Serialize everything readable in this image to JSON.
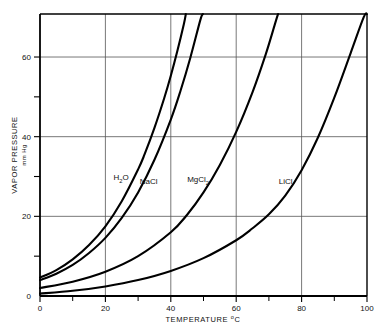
{
  "chart_data": {
    "type": "line",
    "title": "",
    "xlabel": "TEMPERATURE °C",
    "xlabel_main": "TEMPERATURE",
    "xlabel_unit_sup": "o",
    "xlabel_unit": "C",
    "ylabel": "VAPOR PRESSURE",
    "ylabel_sub": "mm Hg",
    "xlim": [
      0,
      100
    ],
    "ylim": [
      0,
      70.8
    ],
    "xticks": [
      0,
      20,
      40,
      60,
      80,
      100
    ],
    "xtick_labels": [
      "0",
      "20",
      "40",
      "60",
      "80",
      "100"
    ],
    "xminor": [
      10,
      30,
      50,
      70,
      90
    ],
    "yticks": [
      0,
      20,
      40,
      60
    ],
    "ytick_labels": [
      "0",
      "20",
      "40",
      "60"
    ],
    "yminor": [
      10,
      30,
      50
    ],
    "grid": "major-xy",
    "legend": "inline-annotations",
    "line_color": "#000000",
    "grid_color": "#555555",
    "frame_color": "#000000",
    "series": [
      {
        "name": "H2O",
        "label_main": "H",
        "label_sub": "2",
        "label_tail": "O",
        "label_x": 22.5,
        "label_y": 29.0,
        "points": [
          [
            0,
            4.6
          ],
          [
            5,
            6.5
          ],
          [
            10,
            9.2
          ],
          [
            15,
            12.8
          ],
          [
            20,
            17.5
          ],
          [
            25,
            23.8
          ],
          [
            30,
            31.8
          ],
          [
            32,
            35.6
          ],
          [
            35,
            42.2
          ],
          [
            38,
            49.7
          ],
          [
            40,
            55.3
          ],
          [
            42,
            61.5
          ],
          [
            44,
            68.3
          ],
          [
            44.6,
            70.8
          ]
        ]
      },
      {
        "name": "NaCl",
        "label_main": "NaCl",
        "label_sub": "",
        "label_tail": "",
        "label_x": 30.5,
        "label_y": 28.0,
        "points": [
          [
            0,
            4.0
          ],
          [
            5,
            5.6
          ],
          [
            10,
            7.8
          ],
          [
            15,
            10.8
          ],
          [
            20,
            14.6
          ],
          [
            25,
            19.6
          ],
          [
            30,
            26.0
          ],
          [
            35,
            34.2
          ],
          [
            40,
            44.3
          ],
          [
            43,
            51.6
          ],
          [
            46,
            59.9
          ],
          [
            49,
            69.2
          ],
          [
            49.8,
            70.8
          ]
        ]
      },
      {
        "name": "MgCl2",
        "label_main": "MgCl",
        "label_sub": "2",
        "label_tail": "",
        "label_x": 45.0,
        "label_y": 28.5,
        "points": [
          [
            0,
            2.0
          ],
          [
            10,
            3.6
          ],
          [
            20,
            6.1
          ],
          [
            30,
            10.0
          ],
          [
            40,
            16.0
          ],
          [
            45,
            20.4
          ],
          [
            50,
            26.0
          ],
          [
            55,
            32.9
          ],
          [
            60,
            41.2
          ],
          [
            65,
            51.2
          ],
          [
            69,
            60.6
          ],
          [
            72,
            68.7
          ],
          [
            72.8,
            70.8
          ]
        ]
      },
      {
        "name": "LiCl",
        "label_main": "LiCl",
        "label_sub": "",
        "label_tail": "",
        "label_x": 73.0,
        "label_y": 28.0,
        "points": [
          [
            0,
            0.6
          ],
          [
            10,
            1.3
          ],
          [
            20,
            2.4
          ],
          [
            30,
            4.0
          ],
          [
            40,
            6.3
          ],
          [
            50,
            9.5
          ],
          [
            60,
            14.0
          ],
          [
            65,
            17.0
          ],
          [
            70,
            20.5
          ],
          [
            75,
            25.2
          ],
          [
            80,
            31.6
          ],
          [
            85,
            39.8
          ],
          [
            90,
            49.8
          ],
          [
            95,
            61.0
          ],
          [
            99,
            70.0
          ],
          [
            100,
            70.8
          ]
        ]
      }
    ]
  }
}
